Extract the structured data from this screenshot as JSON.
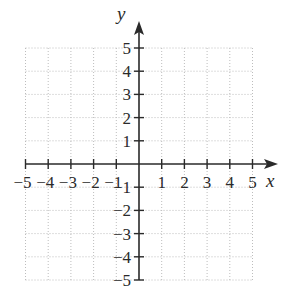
{
  "chart_data": {
    "type": "scatter",
    "title": "",
    "xlabel": "x",
    "ylabel": "y",
    "xlim": [
      -5,
      5
    ],
    "ylim": [
      -5,
      5
    ],
    "grid": true,
    "grid_style": "dotted",
    "x_ticks": [
      -5,
      -4,
      -3,
      -2,
      -1,
      1,
      2,
      3,
      4,
      5
    ],
    "y_ticks": [
      5,
      4,
      3,
      2,
      1,
      -1,
      -2,
      -3,
      -4,
      -5
    ],
    "x_tick_labels": [
      "−5",
      "−4",
      "−3",
      "−2",
      "−1",
      "1",
      "2",
      "3",
      "4",
      "5"
    ],
    "y_tick_labels": [
      "5",
      "4",
      "3",
      "2",
      "1",
      "−1",
      "−2",
      "−3",
      "−4",
      "−5"
    ],
    "series": [],
    "legend": null
  },
  "colors": {
    "axis": "#2a2a2a",
    "grid": "#bdbdbd",
    "background": "#ffffff"
  }
}
